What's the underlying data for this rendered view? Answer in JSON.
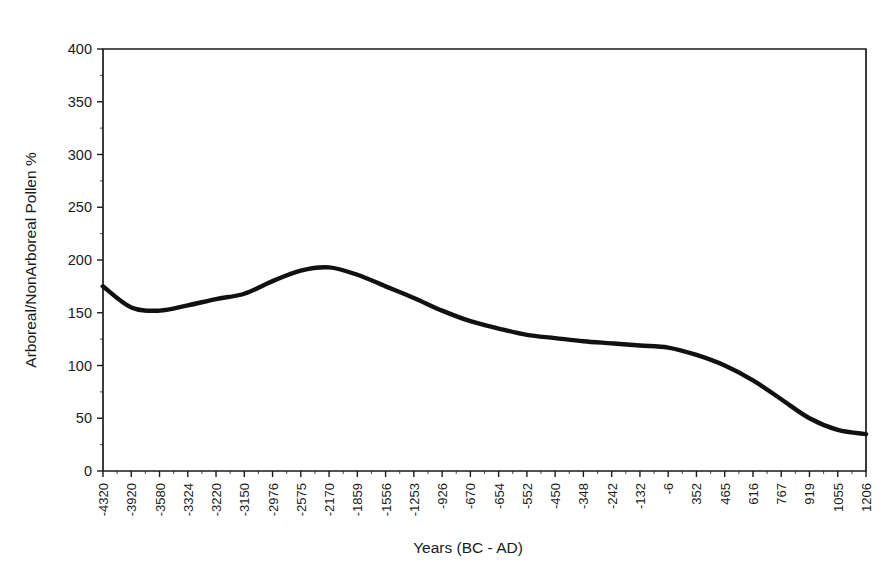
{
  "chart_data": {
    "type": "line",
    "title": "",
    "xlabel": "Years (BC - AD)",
    "ylabel": "Arboreal/NonArboreal Pollen %",
    "ylim": [
      0,
      400
    ],
    "ytick_step": 50,
    "yticks": [
      0,
      50,
      100,
      150,
      200,
      250,
      300,
      350,
      400
    ],
    "ytick_labels": [
      "0",
      "50",
      "100",
      "150",
      "200",
      "250",
      "300",
      "350",
      "400"
    ],
    "grid": false,
    "legend": null,
    "categories": [
      "-4320",
      "-3920",
      "-3580",
      "-3324",
      "-3220",
      "-3150",
      "-2976",
      "-2575",
      "-2170",
      "-1859",
      "-1556",
      "-1253",
      "-926",
      "-670",
      "-654",
      "-552",
      "-450",
      "-348",
      "-242",
      "-132",
      "-6",
      "352",
      "465",
      "616",
      "767",
      "919",
      "1055",
      "1206"
    ],
    "values": [
      175,
      155,
      152,
      157,
      163,
      168,
      180,
      190,
      193,
      186,
      175,
      164,
      152,
      142,
      135,
      129,
      126,
      123,
      121,
      119,
      117,
      110,
      100,
      86,
      68,
      50,
      39,
      35
    ],
    "series_name": "Arboreal/NonArboreal Pollen %",
    "line_color": "#111111",
    "smoothing": "spline",
    "minor_ticks_per_interval": 2
  }
}
